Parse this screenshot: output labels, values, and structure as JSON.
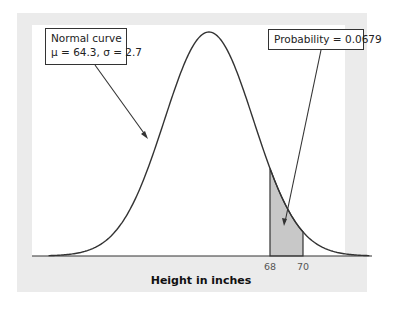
{
  "chart_data": {
    "type": "area",
    "title": "",
    "xlabel": "Height in inches",
    "ylabel": "",
    "distribution": "normal",
    "mean": 64.3,
    "sd": 2.7,
    "shaded_interval": [
      68,
      70
    ],
    "shaded_probability": 0.0679,
    "tick_labels": [
      "68",
      "70"
    ],
    "annotations": [
      {
        "text": [
          "Normal curve",
          "μ = 64.3, σ = 2.7"
        ],
        "points_to": "curve left flank"
      },
      {
        "text": [
          "Probability = 0.0679"
        ],
        "points_to": "shaded region 68–70"
      }
    ],
    "grid": false,
    "colors": {
      "curve": "#333333",
      "shade": "#c8c8c8",
      "panel": "#ebebeb",
      "plot_bg": "#ffffff"
    }
  },
  "callouts": {
    "curve_line1": "Normal curve",
    "curve_line2": "μ = 64.3, σ = 2.7",
    "probability": "Probability = 0.0679"
  },
  "axis": {
    "tick_68": "68",
    "tick_70": "70",
    "xlabel": "Height in inches"
  }
}
